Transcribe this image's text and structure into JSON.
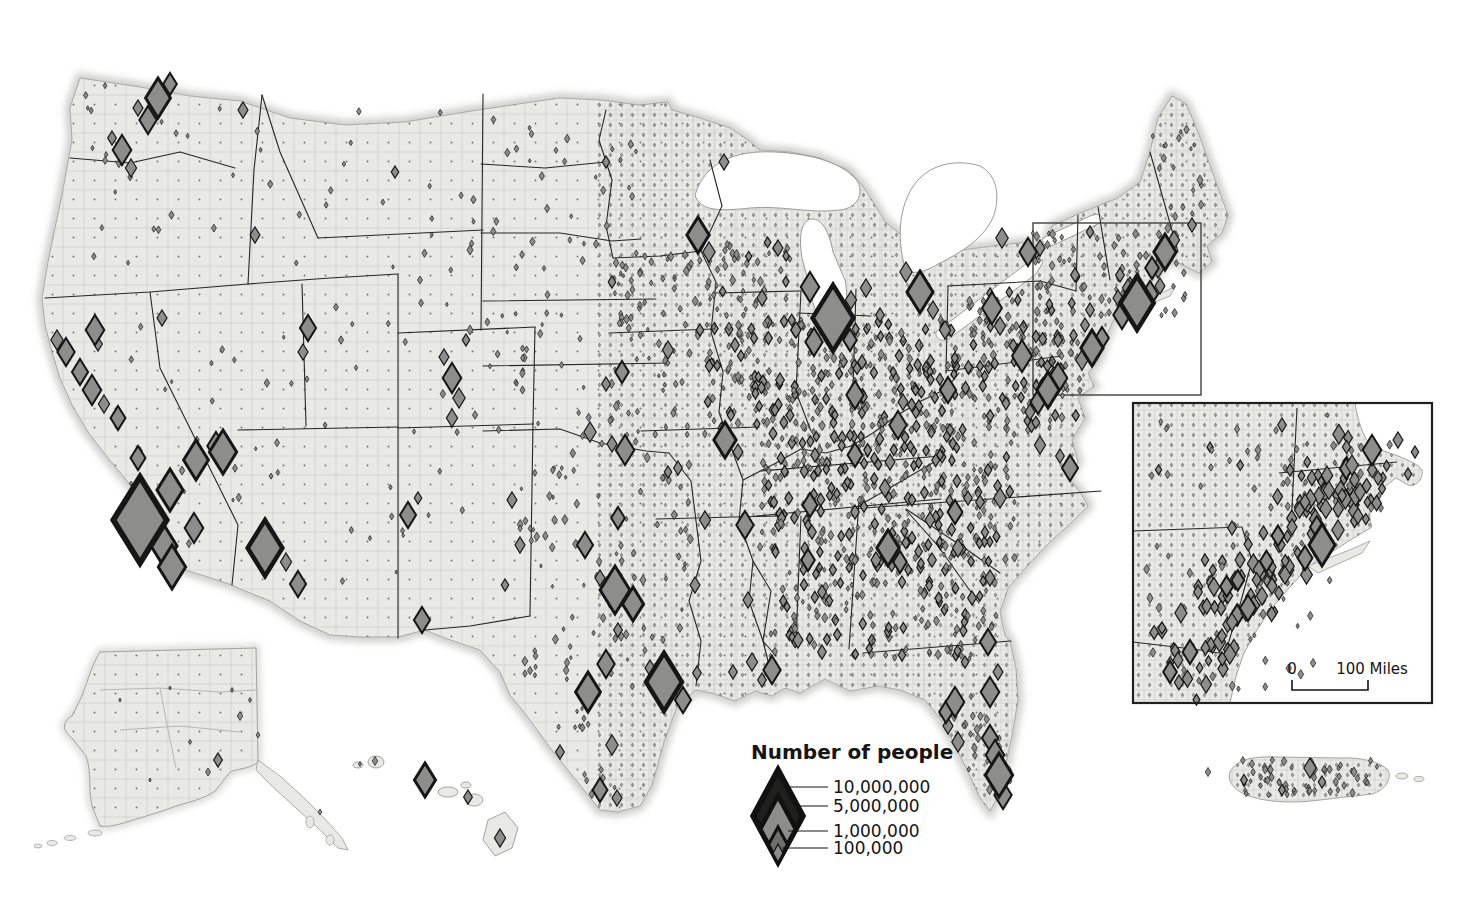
{
  "legend": {
    "title": "Number of people",
    "items": [
      {
        "label": "10,000,000",
        "height_px": 92,
        "fill": "#1f1f1e"
      },
      {
        "label": "5,000,000",
        "height_px": 66,
        "fill": "#8d8d8b"
      },
      {
        "label": "1,000,000",
        "height_px": 35,
        "fill": "#6e6e6c"
      },
      {
        "label": "100,000",
        "height_px": 18,
        "fill": "#8d8d8b"
      }
    ]
  },
  "inset_map": {
    "scale_zero": "0",
    "scale_label": "100 Miles"
  },
  "colors": {
    "land": "#e9e9e6",
    "county_line": "#c2c2c0",
    "county_dot": "#6f6f6d",
    "state_line": "#262624",
    "water": "#ffffff",
    "diamond_fill": "#8d8d8b",
    "diamond_stroke": "#161616",
    "frame": "#1f1f1f",
    "extent_rect": "#3f3f3d",
    "coast_glow": "#cdcdcb"
  },
  "symbols": {
    "major": [
      [
        158,
        98,
        40
      ],
      [
        148,
        120,
        28
      ],
      [
        170,
        84,
        22
      ],
      [
        138,
        108,
        16
      ],
      [
        122,
        150,
        30
      ],
      [
        131,
        168,
        18
      ],
      [
        112,
        138,
        14
      ],
      [
        243,
        110,
        16
      ],
      [
        255,
        235,
        16
      ],
      [
        308,
        328,
        26
      ],
      [
        303,
        352,
        16
      ],
      [
        223,
        452,
        44
      ],
      [
        162,
        318,
        16
      ],
      [
        95,
        330,
        30
      ],
      [
        98,
        344,
        14
      ],
      [
        66,
        352,
        28
      ],
      [
        57,
        340,
        20
      ],
      [
        80,
        372,
        26
      ],
      [
        92,
        390,
        30
      ],
      [
        104,
        404,
        18
      ],
      [
        118,
        418,
        24
      ],
      [
        138,
        458,
        24
      ],
      [
        140,
        520,
        86
      ],
      [
        170,
        490,
        42
      ],
      [
        196,
        460,
        40
      ],
      [
        216,
        446,
        28
      ],
      [
        164,
        546,
        42
      ],
      [
        194,
        528,
        30
      ],
      [
        172,
        567,
        44
      ],
      [
        265,
        548,
        56
      ],
      [
        286,
        562,
        18
      ],
      [
        298,
        584,
        26
      ],
      [
        408,
        515,
        26
      ],
      [
        418,
        498,
        12
      ],
      [
        422,
        620,
        26
      ],
      [
        452,
        378,
        30
      ],
      [
        459,
        398,
        20
      ],
      [
        444,
        357,
        16
      ],
      [
        452,
        418,
        18
      ],
      [
        466,
        340,
        12
      ],
      [
        395,
        172,
        12
      ],
      [
        470,
        250,
        10
      ],
      [
        470,
        330,
        10
      ],
      [
        420,
        280,
        8
      ],
      [
        606,
        162,
        12
      ],
      [
        612,
        282,
        12
      ],
      [
        724,
        162,
        16
      ],
      [
        698,
        235,
        36
      ],
      [
        709,
        252,
        20
      ],
      [
        762,
        298,
        16
      ],
      [
        810,
        287,
        30
      ],
      [
        778,
        248,
        16
      ],
      [
        833,
        318,
        66
      ],
      [
        814,
        342,
        28
      ],
      [
        850,
        340,
        22
      ],
      [
        851,
        300,
        18
      ],
      [
        796,
        330,
        16
      ],
      [
        920,
        292,
        42
      ],
      [
        906,
        272,
        20
      ],
      [
        933,
        310,
        18
      ],
      [
        880,
        315,
        14
      ],
      [
        866,
        288,
        18
      ],
      [
        945,
        330,
        18
      ],
      [
        992,
        308,
        32
      ],
      [
        1000,
        326,
        18
      ],
      [
        948,
        390,
        26
      ],
      [
        898,
        425,
        28
      ],
      [
        903,
        402,
        16
      ],
      [
        855,
        395,
        28
      ],
      [
        862,
        362,
        14
      ],
      [
        1022,
        356,
        32
      ],
      [
        1028,
        252,
        28
      ],
      [
        1002,
        238,
        20
      ],
      [
        1040,
        248,
        16
      ],
      [
        1075,
        275,
        14
      ],
      [
        1090,
        232,
        12
      ],
      [
        622,
        372,
        22
      ],
      [
        606,
        384,
        14
      ],
      [
        668,
        350,
        18
      ],
      [
        700,
        330,
        12
      ],
      [
        735,
        345,
        14
      ],
      [
        780,
        380,
        14
      ],
      [
        795,
        330,
        14
      ],
      [
        775,
        410,
        12
      ],
      [
        625,
        450,
        30
      ],
      [
        612,
        444,
        16
      ],
      [
        590,
        432,
        20
      ],
      [
        725,
        440,
        36
      ],
      [
        738,
        452,
        16
      ],
      [
        678,
        468,
        14
      ],
      [
        815,
        455,
        14
      ],
      [
        855,
        455,
        24
      ],
      [
        890,
        462,
        16
      ],
      [
        810,
        505,
        24
      ],
      [
        885,
        488,
        18
      ],
      [
        855,
        512,
        14
      ],
      [
        745,
        525,
        28
      ],
      [
        705,
        520,
        18
      ],
      [
        668,
        472,
        12
      ],
      [
        585,
        545,
        26
      ],
      [
        618,
        518,
        22
      ],
      [
        512,
        500,
        16
      ],
      [
        520,
        545,
        16
      ],
      [
        505,
        585,
        12
      ],
      [
        615,
        590,
        48
      ],
      [
        633,
        604,
        34
      ],
      [
        600,
        578,
        16
      ],
      [
        618,
        630,
        14
      ],
      [
        606,
        664,
        28
      ],
      [
        588,
        692,
        40
      ],
      [
        664,
        682,
        58
      ],
      [
        683,
        700,
        26
      ],
      [
        650,
        668,
        16
      ],
      [
        697,
        673,
        14
      ],
      [
        612,
        745,
        20
      ],
      [
        560,
        752,
        14
      ],
      [
        600,
        790,
        24
      ],
      [
        617,
        798,
        16
      ],
      [
        695,
        585,
        16
      ],
      [
        752,
        662,
        18
      ],
      [
        772,
        670,
        28
      ],
      [
        762,
        680,
        14
      ],
      [
        733,
        672,
        14
      ],
      [
        748,
        600,
        16
      ],
      [
        798,
        640,
        16
      ],
      [
        822,
        652,
        14
      ],
      [
        808,
        560,
        22
      ],
      [
        812,
        532,
        14
      ],
      [
        822,
        592,
        14
      ],
      [
        888,
        548,
        36
      ],
      [
        900,
        562,
        22
      ],
      [
        876,
        560,
        16
      ],
      [
        902,
        582,
        12
      ],
      [
        932,
        560,
        14
      ],
      [
        958,
        548,
        18
      ],
      [
        990,
        578,
        16
      ],
      [
        972,
        598,
        14
      ],
      [
        955,
        512,
        24
      ],
      [
        930,
        520,
        16
      ],
      [
        912,
        500,
        12
      ],
      [
        968,
        498,
        14
      ],
      [
        1000,
        498,
        20
      ],
      [
        980,
        502,
        14
      ],
      [
        1070,
        468,
        26
      ],
      [
        1060,
        456,
        14
      ],
      [
        1040,
        445,
        18
      ],
      [
        988,
        470,
        12
      ],
      [
        950,
        430,
        12
      ],
      [
        1048,
        390,
        36
      ],
      [
        1058,
        378,
        30
      ],
      [
        1038,
        402,
        24
      ],
      [
        1030,
        412,
        16
      ],
      [
        1092,
        348,
        36
      ],
      [
        1102,
        338,
        22
      ],
      [
        1082,
        360,
        20
      ],
      [
        1058,
        340,
        14
      ],
      [
        1085,
        325,
        14
      ],
      [
        1090,
        310,
        14
      ],
      [
        1137,
        303,
        54
      ],
      [
        1122,
        315,
        28
      ],
      [
        1150,
        294,
        26
      ],
      [
        1130,
        286,
        18
      ],
      [
        1160,
        286,
        16
      ],
      [
        1128,
        288,
        18
      ],
      [
        1118,
        298,
        16
      ],
      [
        1158,
        268,
        20
      ],
      [
        1165,
        252,
        36
      ],
      [
        1152,
        268,
        22
      ],
      [
        1174,
        240,
        18
      ],
      [
        1120,
        275,
        14
      ],
      [
        1192,
        225,
        14
      ],
      [
        1200,
        180,
        10
      ],
      [
        988,
        642,
        26
      ],
      [
        990,
        692,
        30
      ],
      [
        998,
        672,
        16
      ],
      [
        955,
        702,
        30
      ],
      [
        946,
        712,
        22
      ],
      [
        948,
        726,
        16
      ],
      [
        958,
        742,
        20
      ],
      [
        990,
        738,
        26
      ],
      [
        995,
        755,
        30
      ],
      [
        999,
        775,
        44
      ],
      [
        1003,
        795,
        28
      ],
      [
        902,
        655,
        12
      ],
      [
        965,
        662,
        12
      ]
    ],
    "scatter_rects": [
      [
        705,
        320,
        1080,
        430,
        380,
        5,
        13,
        11
      ],
      [
        705,
        240,
        790,
        318,
        45,
        5,
        11,
        12
      ],
      [
        1030,
        230,
        1090,
        318,
        35,
        5,
        11,
        13
      ],
      [
        960,
        290,
        1030,
        330,
        20,
        5,
        11,
        28
      ],
      [
        760,
        430,
        1015,
        560,
        280,
        5,
        13,
        14
      ],
      [
        770,
        560,
        1000,
        660,
        150,
        5,
        12,
        15
      ],
      [
        610,
        250,
        705,
        450,
        70,
        4,
        10,
        17
      ],
      [
        485,
        105,
        640,
        450,
        70,
        4,
        9,
        18
      ],
      [
        520,
        450,
        695,
        690,
        90,
        4,
        10,
        19
      ],
      [
        255,
        85,
        480,
        620,
        55,
        4,
        9,
        21
      ],
      [
        85,
        85,
        250,
        300,
        22,
        4,
        9,
        22
      ],
      [
        130,
        310,
        245,
        555,
        22,
        4,
        9,
        23
      ],
      [
        1095,
        225,
        1195,
        320,
        40,
        4,
        10,
        24
      ],
      [
        1150,
        120,
        1205,
        225,
        18,
        4,
        9,
        25
      ]
    ],
    "scatter_bands": [
      [
        958,
        690,
        1000,
        790,
        22,
        30,
        5,
        10,
        16
      ],
      [
        565,
        700,
        608,
        795,
        18,
        14,
        4,
        9,
        20
      ]
    ]
  },
  "alaska": {
    "symbols": [
      [
        218,
        760,
        14
      ],
      [
        240,
        716,
        9
      ],
      [
        208,
        772,
        8
      ],
      [
        320,
        812,
        6
      ],
      [
        250,
        700,
        5
      ],
      [
        190,
        742,
        5
      ],
      [
        232,
        690,
        5
      ],
      [
        150,
        780,
        4
      ],
      [
        258,
        735,
        6
      ],
      [
        120,
        700,
        4
      ],
      [
        170,
        688,
        4
      ]
    ]
  },
  "hawaii": {
    "symbols": [
      [
        425,
        780,
        34
      ],
      [
        375,
        761,
        9
      ],
      [
        468,
        797,
        14
      ],
      [
        500,
        838,
        18
      ],
      [
        360,
        764,
        5
      ]
    ]
  },
  "puerto_rico": {
    "symbols": [
      [
        1310,
        768,
        20
      ],
      [
        1322,
        782,
        12
      ],
      [
        1282,
        790,
        11
      ],
      [
        1244,
        780,
        11
      ],
      [
        1208,
        772,
        9
      ],
      [
        1354,
        772,
        10
      ]
    ],
    "scatter_rects": [
      [
        1240,
        760,
        1378,
        796,
        55,
        5,
        9,
        41
      ]
    ]
  },
  "inset_symbols": {
    "major": [
      [
        1322,
        545,
        42
      ],
      [
        1305,
        558,
        24
      ],
      [
        1338,
        530,
        20
      ],
      [
        1358,
        516,
        16
      ],
      [
        1292,
        527,
        16
      ],
      [
        1305,
        502,
        16
      ],
      [
        1285,
        575,
        18
      ],
      [
        1272,
        586,
        16
      ],
      [
        1248,
        608,
        26
      ],
      [
        1262,
        596,
        18
      ],
      [
        1232,
        622,
        18
      ],
      [
        1222,
        636,
        14
      ],
      [
        1190,
        652,
        24
      ],
      [
        1170,
        672,
        22
      ],
      [
        1178,
        660,
        16
      ],
      [
        1372,
        450,
        30
      ],
      [
        1352,
        465,
        20
      ],
      [
        1360,
        492,
        18
      ],
      [
        1378,
        478,
        14
      ],
      [
        1408,
        474,
        12
      ],
      [
        1282,
        425,
        14
      ],
      [
        1290,
        470,
        12
      ],
      [
        1240,
        560,
        16
      ],
      [
        1232,
        528,
        14
      ],
      [
        1198,
        592,
        14
      ],
      [
        1272,
        585,
        14
      ],
      [
        1318,
        475,
        12
      ],
      [
        1258,
        450,
        10
      ],
      [
        1205,
        560,
        12
      ],
      [
        1162,
        628,
        12
      ],
      [
        1150,
        598,
        10
      ],
      [
        1398,
        440,
        16
      ],
      [
        1415,
        452,
        12
      ]
    ],
    "scatter_rects": [
      [
        1145,
        415,
        1330,
        690,
        60,
        5,
        11,
        32
      ],
      [
        1300,
        440,
        1390,
        520,
        25,
        5,
        12,
        33
      ]
    ],
    "scatter_bands": [
      [
        1165,
        678,
        1372,
        452,
        40,
        90,
        7,
        20,
        31
      ],
      [
        1180,
        660,
        1360,
        470,
        18,
        40,
        10,
        22,
        34
      ]
    ]
  }
}
